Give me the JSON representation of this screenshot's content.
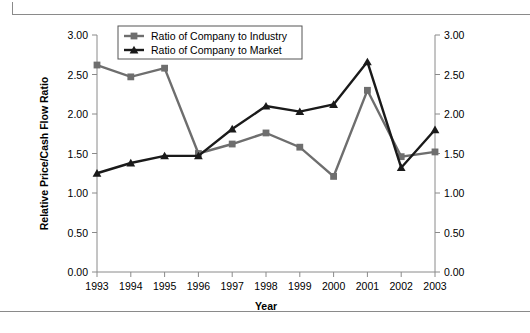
{
  "chart_data": {
    "type": "line",
    "title": "",
    "xlabel": "Year",
    "ylabel": "Relative Price/Cash Flow Ratio",
    "ylabel_right": "",
    "categories": [
      "1993",
      "1994",
      "1995",
      "1996",
      "1997",
      "1998",
      "1999",
      "2000",
      "2001",
      "2002",
      "2003"
    ],
    "ylim": [
      0.0,
      3.0
    ],
    "ytick_labels": [
      "0.00",
      "0.50",
      "1.00",
      "1.50",
      "2.00",
      "2.50",
      "3.00"
    ],
    "ytick_values": [
      0.0,
      0.5,
      1.0,
      1.5,
      2.0,
      2.5,
      3.0
    ],
    "ytick_labels_right": [
      "0.00",
      "0.50",
      "1.00",
      "1.50",
      "2.00",
      "2.50",
      "3.00"
    ],
    "grid": false,
    "legend_position": "top-left-inside",
    "series": [
      {
        "name": "Ratio of Company to Industry",
        "color": "#6e6e6e",
        "marker": "square",
        "values": [
          2.62,
          2.47,
          2.58,
          1.5,
          1.62,
          1.76,
          1.58,
          1.21,
          2.3,
          1.46,
          1.52
        ]
      },
      {
        "name": "Ratio of Company to Market",
        "color": "#1a1a1a",
        "marker": "triangle",
        "values": [
          1.25,
          1.38,
          1.47,
          1.47,
          1.81,
          2.1,
          2.03,
          2.12,
          2.66,
          1.32,
          1.8
        ]
      }
    ]
  },
  "legend": {
    "entries": [
      {
        "label": "Ratio of Company to Industry"
      },
      {
        "label": "Ratio of Company to Market"
      }
    ]
  },
  "axes": {
    "x_title": "Year",
    "y_title": "Relative Price/Cash Flow Ratio"
  },
  "colors": {
    "industry": "#6e6e6e",
    "market": "#1a1a1a",
    "axis": "#8a8a8a",
    "rule": "#8a8a8a"
  }
}
